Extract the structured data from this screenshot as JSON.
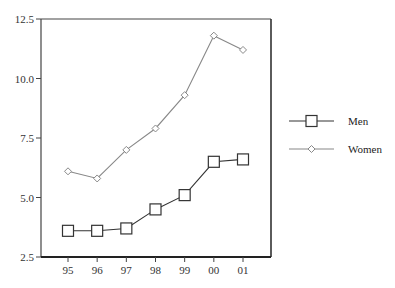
{
  "chart_data": {
    "type": "line",
    "title": "",
    "xlabel": "",
    "ylabel": "",
    "categories": [
      "95",
      "96",
      "97",
      "98",
      "99",
      "00",
      "01"
    ],
    "series": [
      {
        "name": "Men",
        "marker": "square",
        "color": "#333333",
        "values": [
          3.6,
          3.6,
          3.7,
          4.5,
          5.1,
          6.5,
          6.6
        ]
      },
      {
        "name": "Women",
        "marker": "diamond",
        "color": "#888888",
        "values": [
          6.1,
          5.8,
          7.0,
          7.9,
          9.3,
          11.8,
          11.2
        ]
      }
    ],
    "ylim": [
      2.5,
      12.5
    ],
    "yticks": [
      "2.5",
      "5.0",
      "7.5",
      "10.0",
      "12.5"
    ],
    "grid": false,
    "legend_position": "right"
  },
  "legend": {
    "items": [
      {
        "label": "Men"
      },
      {
        "label": "Women"
      }
    ]
  }
}
